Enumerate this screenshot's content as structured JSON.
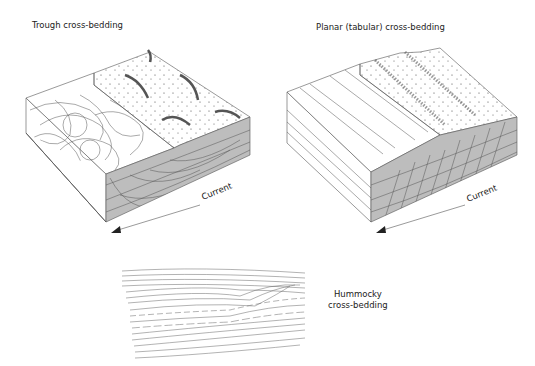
{
  "diagrams": [
    {
      "id": "trough",
      "title": "Trough cross-bedding",
      "current_label": "Current"
    },
    {
      "id": "planar",
      "title": "Planar (tabular) cross-bedding",
      "current_label": "Current"
    },
    {
      "id": "hummocky",
      "title_line1": "Hummocky",
      "title_line2": "cross-bedding"
    }
  ],
  "colors": {
    "line": "#555555",
    "shade": "#bdbdbd",
    "dots": "#333333"
  }
}
